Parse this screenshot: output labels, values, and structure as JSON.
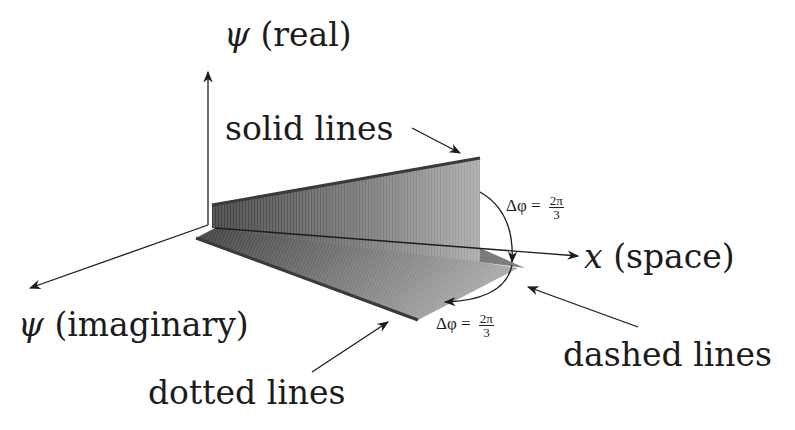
{
  "figure": {
    "type": "3D wave-component diagram",
    "axes": {
      "real": {
        "symbol": "ψ",
        "label": "(real)"
      },
      "imaginary": {
        "symbol": "ψ",
        "label": "(imaginary)"
      },
      "space": {
        "symbol": "x",
        "label": "(space)"
      }
    },
    "annotations": {
      "solid": "solid lines",
      "dashed": "dashed lines",
      "dotted": "dotted lines"
    },
    "phase_labels": [
      {
        "prefix": "Δφ =",
        "numerator": "2π",
        "denominator": "3"
      },
      {
        "prefix": "Δφ =",
        "numerator": "2π",
        "denominator": "3"
      }
    ],
    "colors": {
      "ink": "#1c1c1c",
      "plane_dark": "#4a4a4a",
      "plane_mid": "#7a7a7a",
      "plane_light": "#b5b5b5",
      "background": "#ffffff"
    }
  }
}
